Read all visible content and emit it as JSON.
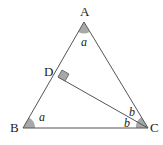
{
  "figure": {
    "type": "geometry-triangle",
    "vertices": {
      "A": "A",
      "B": "B",
      "C": "C",
      "D": "D"
    },
    "angle_labels": {
      "at_A": "a",
      "at_B": "a",
      "at_C_upper": "b",
      "at_C_lower": "b"
    },
    "segments": [
      "AB",
      "BC",
      "CA",
      "CD"
    ],
    "right_angle_at": "D",
    "colors": {
      "line": "#555555",
      "angle_fill": "#a8a8a8"
    }
  }
}
